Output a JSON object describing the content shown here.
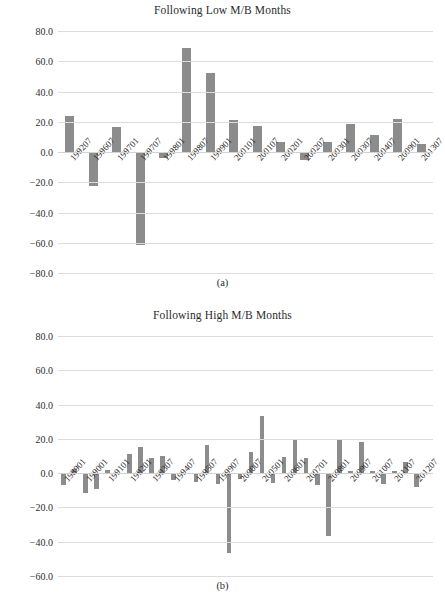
{
  "page": {
    "background_color": "#ffffff",
    "bar_color": "#8c8c8c",
    "gridline_color": "#dcdcdc",
    "text_color": "#2b2b2b"
  },
  "panel_a": {
    "caption": "(a)",
    "title": "Following Low M/B Months",
    "y_ticks": [
      "80.0",
      "60.0",
      "40.0",
      "20.0",
      "0.0",
      "-20.0",
      "-40.0",
      "-60.0",
      "-80.0"
    ]
  },
  "panel_b": {
    "caption": "(b)",
    "title": "Following High M/B Months",
    "y_ticks": [
      "80.0",
      "60.0",
      "40.0",
      "20.0",
      "0.0",
      "-20.0",
      "-40.0",
      "-60.0"
    ]
  },
  "chart_data": [
    {
      "type": "bar",
      "title": "Following Low M/B Months",
      "subfigure": "(a)",
      "xlabel": "",
      "ylabel": "",
      "ylim": [
        -80,
        80
      ],
      "ytick_step": 20,
      "grid": true,
      "legend": null,
      "bar_color": "#8c8c8c",
      "categories": [
        "199207",
        "199607",
        "199701",
        "199707",
        "199801",
        "199807",
        "199901",
        "200101",
        "200107",
        "200201",
        "200207",
        "200301",
        "200307",
        "200407",
        "200901",
        "201307"
      ],
      "values": [
        23.5,
        -22.5,
        16.5,
        -61.5,
        -4.0,
        69.0,
        52.5,
        21.0,
        17.5,
        6.5,
        -5.5,
        6.5,
        18.5,
        11.0,
        22.0,
        5.5
      ]
    },
    {
      "type": "bar",
      "title": "Following High M/B Months",
      "subfigure": "(b)",
      "xlabel": "",
      "ylabel": "",
      "ylim": [
        -60,
        80
      ],
      "ytick_step": 20,
      "grid": true,
      "legend": null,
      "bar_color": "#8c8c8c",
      "categories": [
        "198901",
        "198907",
        "199001",
        "199007",
        "199101",
        "199107",
        "199201",
        "199207",
        "199307",
        "199401",
        "199407",
        "199501",
        "199507",
        "199601",
        "199907",
        "200001",
        "200007",
        "200101",
        "200501",
        "200507",
        "200601",
        "200607",
        "200701",
        "200707",
        "200801",
        "200807",
        "200907",
        "201001",
        "201007",
        "201101",
        "201107",
        "201201",
        "201207",
        "201301"
      ],
      "values": [
        -7.0,
        2.5,
        -11.5,
        -9.5,
        2.0,
        -0.5,
        11.0,
        15.5,
        9.0,
        10.0,
        -4.0,
        -0.5,
        -5.0,
        16.5,
        -6.5,
        -46.5,
        -3.5,
        12.5,
        33.5,
        -5.5,
        9.5,
        19.5,
        9.0,
        -7.0,
        -36.5,
        19.5,
        1.0,
        18.0,
        1.5,
        -6.5,
        1.0,
        6.5,
        -8.0,
        0.0
      ]
    }
  ]
}
